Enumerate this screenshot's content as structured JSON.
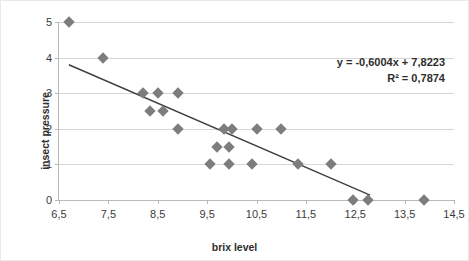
{
  "chart_data": {
    "type": "scatter",
    "title": "",
    "xlabel": "brix level",
    "ylabel": "insect pressure",
    "xlim": [
      6.5,
      14.5
    ],
    "ylim": [
      0,
      5
    ],
    "x_ticks": [
      "6,5",
      "7,5",
      "8,5",
      "9,5",
      "10,5",
      "11,5",
      "12,5",
      "13,5",
      "14,5"
    ],
    "x_tick_values": [
      6.5,
      7.5,
      8.5,
      9.5,
      10.5,
      11.5,
      12.5,
      13.5,
      14.5
    ],
    "y_ticks": [
      "0",
      "1",
      "2",
      "3",
      "4",
      "5"
    ],
    "y_tick_values": [
      0,
      1,
      2,
      3,
      4,
      5
    ],
    "grid": "horizontal",
    "legend": "none",
    "marker": "diamond",
    "marker_color": "#7d7d7d",
    "trendline_color": "#404040",
    "points": [
      {
        "x": 6.7,
        "y": 5
      },
      {
        "x": 7.4,
        "y": 4
      },
      {
        "x": 8.2,
        "y": 3
      },
      {
        "x": 8.5,
        "y": 3
      },
      {
        "x": 8.9,
        "y": 3
      },
      {
        "x": 8.35,
        "y": 2.5
      },
      {
        "x": 8.6,
        "y": 2.5
      },
      {
        "x": 8.9,
        "y": 2
      },
      {
        "x": 9.85,
        "y": 2
      },
      {
        "x": 10.0,
        "y": 2
      },
      {
        "x": 10.5,
        "y": 2
      },
      {
        "x": 11.0,
        "y": 2
      },
      {
        "x": 9.7,
        "y": 1.5
      },
      {
        "x": 9.95,
        "y": 1.5
      },
      {
        "x": 9.55,
        "y": 1
      },
      {
        "x": 9.95,
        "y": 1
      },
      {
        "x": 10.4,
        "y": 1
      },
      {
        "x": 11.35,
        "y": 1
      },
      {
        "x": 12.0,
        "y": 1
      },
      {
        "x": 12.45,
        "y": 0
      },
      {
        "x": 12.75,
        "y": 0
      },
      {
        "x": 13.9,
        "y": 0
      }
    ],
    "trendline": {
      "slope": -0.6004,
      "intercept": 7.8223,
      "x_start": 6.7,
      "x_end": 12.8
    },
    "annotations": {
      "equation": "y = -0,6004x + 7,8223",
      "r_squared": "R² = 0,7874"
    }
  }
}
